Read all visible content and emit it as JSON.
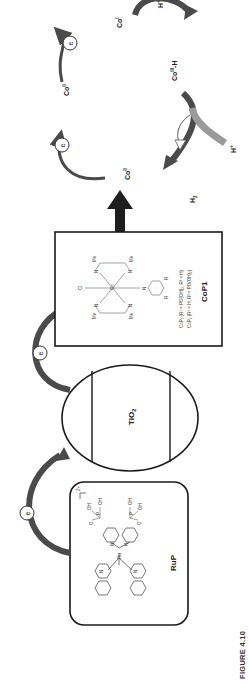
{
  "figure": {
    "caption": "FIGURE 4.10",
    "orientation": "rotated -90deg (landscape figure printed sideways)",
    "colors": {
      "arrow_dark": "#4a4a4a",
      "arrow_mid": "#6b6b6b",
      "arrow_light": "#9a9a9a",
      "box_stroke": "#1a1a1a",
      "main_arrow": "#1e1e1e"
    }
  },
  "components": {
    "photosensitizer": {
      "label": "RuP",
      "charge": "2+",
      "atoms": {
        "ru": "Ru",
        "n": "N",
        "p": "P",
        "o": "O",
        "oh": "OH"
      }
    },
    "semiconductor": {
      "label": "TiO",
      "subscript": "2"
    },
    "catalyst": {
      "label": "CoP1",
      "atoms": {
        "co": "Co",
        "cl": "Cl",
        "n": "N",
        "o": "O",
        "h": "H",
        "me": "Me",
        "r1": "R",
        "r2": "R"
      },
      "legend": [
        "CoP₁ (R¹ = PO(OH)₂, R² = H)",
        "CoP₂ (R¹ = H, R² = PO(OH)₂)"
      ]
    }
  },
  "electron": {
    "symbol": "e"
  },
  "cycle": {
    "co_ii_top": {
      "base": "Co",
      "sup": "II"
    },
    "co_i": {
      "base": "Co",
      "sup": "I"
    },
    "co_iii_h": {
      "base": "Co",
      "sup": "III",
      "suffix": "-H"
    },
    "co_ii_bottom": {
      "base": "Co",
      "sup": "II"
    },
    "proton_1": {
      "base": "H",
      "sup": "+"
    },
    "proton_2": {
      "base": "H",
      "sup": "+"
    },
    "hydrogen": {
      "base": "H",
      "sub": "2"
    }
  }
}
